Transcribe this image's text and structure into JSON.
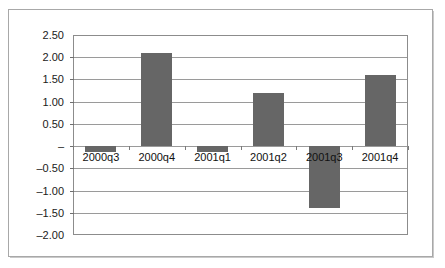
{
  "chart_data": {
    "type": "bar",
    "title": "",
    "subtitle": "",
    "xlabel": "",
    "ylabel": "",
    "categories": [
      "2000q3",
      "2000q4",
      "2001q1",
      "2001q2",
      "2001q3",
      "2001q4"
    ],
    "values": [
      -0.13,
      2.1,
      -0.13,
      1.2,
      -1.4,
      1.6
    ],
    "ylim": [
      -2.0,
      2.5
    ],
    "ytick_values": [
      2.5,
      2.0,
      1.5,
      1.0,
      0.5,
      0.0,
      -0.5,
      -1.0,
      -1.5,
      -2.0
    ],
    "ytick_labels": [
      "2.50",
      "2.00",
      "1.50",
      "1.00",
      "0.50",
      "–",
      "–0.50",
      "–1.00",
      "–1.50",
      "–2.00"
    ],
    "ytick_step": 0.5,
    "grid": true,
    "grid_axis": "y",
    "legend": false,
    "legend_position": "none",
    "bar_color": "#666666",
    "gridline_color": "#9a9a9a",
    "plot_border_color": "#8c8c8c",
    "frame_color": "#a8a8a8",
    "axis_text_color": "#111111",
    "zero_label_style": "dash",
    "category_labels_inside_plot": true
  }
}
